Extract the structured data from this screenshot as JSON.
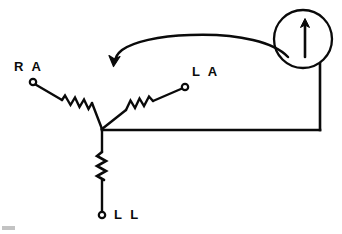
{
  "figure": {
    "type": "hand-drawn-circuit-schematic",
    "background_color": "#ffffff",
    "ink_color": "#0a0a0a",
    "width": 342,
    "height": 234
  },
  "labels": {
    "right_arm": "R A",
    "left_arm": "L A",
    "left_leg": "L L"
  },
  "terminals": [
    {
      "name": "right-arm-terminal",
      "label": "R A",
      "x": 33,
      "y": 82
    },
    {
      "name": "left-arm-terminal",
      "label": "L A",
      "x": 185,
      "y": 87
    },
    {
      "name": "left-leg-terminal",
      "label": "L L",
      "x": 102,
      "y": 215
    }
  ],
  "junction": {
    "name": "central-node",
    "x": 102,
    "y": 129
  },
  "resistors": [
    {
      "name": "right-arm-resistor",
      "orientation": "diagonal",
      "peaks": 6
    },
    {
      "name": "left-arm-resistor",
      "orientation": "diagonal",
      "peaks": 5
    },
    {
      "name": "left-leg-resistor",
      "orientation": "vertical",
      "peaks": 5
    }
  ],
  "meter": {
    "name": "galvanometer",
    "shape": "circle",
    "center_x": 303,
    "center_y": 39,
    "radius": 29,
    "indicator": "up-arrow"
  },
  "wires": [
    {
      "name": "meter-lead-wire",
      "path": "vertical-down-then-left"
    },
    {
      "name": "junction-horizontal-wire",
      "path": "junction-to-meter-lead"
    }
  ],
  "annotation": {
    "name": "pointer-arrow",
    "shape": "curved-arrow",
    "direction": "right-to-left",
    "points_to": "galvanometer"
  },
  "artifact": {
    "name": "scan-smudge",
    "visible": true
  }
}
